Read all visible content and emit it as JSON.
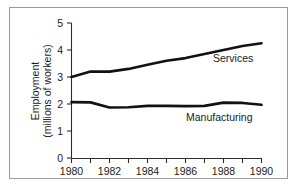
{
  "chart_data": {
    "type": "line",
    "title": "",
    "xlabel": "",
    "ylabel": "Employment (millions of workers)",
    "ylabel_line1": "Employment",
    "ylabel_line2": "(millions of workers)",
    "x": [
      1980,
      1981,
      1982,
      1983,
      1984,
      1985,
      1986,
      1987,
      1988,
      1989,
      1990
    ],
    "xlim": [
      1980,
      1990
    ],
    "ylim": [
      0,
      5
    ],
    "xticks_major": [
      "1980",
      "1982",
      "1984",
      "1986",
      "1988",
      "1990"
    ],
    "xticks_major_values": [
      1980,
      1982,
      1984,
      1986,
      1988,
      1990
    ],
    "xticks_minor_values": [
      1981,
      1983,
      1985,
      1987,
      1989
    ],
    "yticks": [
      "0",
      "1",
      "2",
      "3",
      "4",
      "5"
    ],
    "yticks_values": [
      0,
      1,
      2,
      3,
      4,
      5
    ],
    "grid": false,
    "legend_position": "inline-labels",
    "series": [
      {
        "name": "Services",
        "label": "Services",
        "color": "#111111",
        "values": [
          3.0,
          3.2,
          3.2,
          3.3,
          3.45,
          3.6,
          3.7,
          3.85,
          4.0,
          4.15,
          4.25
        ]
      },
      {
        "name": "Manufacturing",
        "label": "Manufacturing",
        "color": "#111111",
        "values": [
          2.07,
          2.06,
          1.87,
          1.88,
          1.93,
          1.93,
          1.92,
          1.93,
          2.05,
          2.04,
          1.97
        ]
      }
    ],
    "annotations": [
      {
        "text": "Services",
        "x": 1987.6,
        "y": 3.55
      },
      {
        "text": "Manufacturing",
        "x": 1985.9,
        "y": 1.53
      }
    ]
  }
}
